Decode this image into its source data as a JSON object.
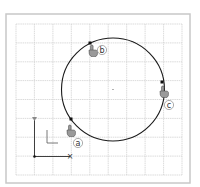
{
  "diagram": {
    "title": "",
    "colors": {
      "background": "#ffffff",
      "outer_border": "#c8c8c8",
      "grid_line": "#d2d2d2",
      "curve": "#1a1a1a",
      "axis": "#2a2a2a",
      "marker": "#111111",
      "cursor_fill": "#9a9a9a",
      "label_ring": "#8a8a8a"
    },
    "outer_frame": {
      "x": 6,
      "y": 14,
      "w": 184,
      "h": 169
    },
    "grid": {
      "x0": 16,
      "y0": 24,
      "x1": 182,
      "y1": 175,
      "cols": [
        16,
        34.4,
        52.9,
        71.3,
        89.8,
        108.2,
        126.7,
        145.1,
        163.6,
        182
      ],
      "rows": [
        24,
        42.9,
        61.8,
        80.6,
        99.5,
        118.4,
        137.2,
        156.1,
        175
      ]
    },
    "circle": {
      "cx": 113,
      "cy": 89.5,
      "r": 51.5,
      "center_marker": true
    },
    "axes": {
      "origin": {
        "x": 34.5,
        "y": 156.5
      },
      "y_end": {
        "x": 34.5,
        "y": 119
      },
      "x_end": {
        "x": 70,
        "y": 156.5
      },
      "x_end_marker": "×",
      "y_end_marker": "▾"
    },
    "corner_glyph": {
      "x": 47,
      "y": 130,
      "w": 11,
      "h": 13
    },
    "points": [
      {
        "id": "a",
        "label": "a",
        "x": 71,
        "y": 119,
        "cursor_x": 66,
        "cursor_y": 125,
        "label_x": 78,
        "label_y": 143
      },
      {
        "id": "b",
        "label": "b",
        "x": 90,
        "y": 43,
        "cursor_x": 88,
        "cursor_y": 45,
        "label_x": 102,
        "label_y": 50
      },
      {
        "id": "c",
        "label": "c",
        "x": 162,
        "y": 82,
        "cursor_x": 159,
        "cursor_y": 86,
        "label_x": 169,
        "label_y": 105
      }
    ]
  }
}
